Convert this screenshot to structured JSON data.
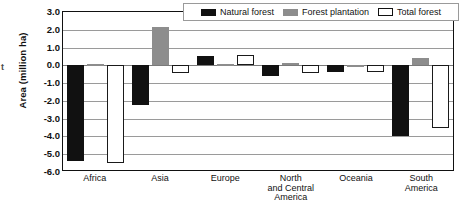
{
  "chart_data": {
    "type": "bar",
    "title": "",
    "xlabel": "",
    "ylabel": "Area (million ha)",
    "ylim": [
      -6.0,
      3.0
    ],
    "ytick_step": 1.0,
    "grid": true,
    "legend_position": "top-right",
    "yticks": [
      "3.0",
      "2.0",
      "1.0",
      "0.0",
      "-1.0",
      "-2.0",
      "-3.0",
      "-4.0",
      "-5.0",
      "-6.0"
    ],
    "categories": [
      "Africa",
      "Asia",
      "Europe",
      "North and Central America",
      "Oceania",
      "South America"
    ],
    "category_lines": [
      [
        "Africa"
      ],
      [
        "Asia"
      ],
      [
        "Europe"
      ],
      [
        "North",
        "and Central",
        "America"
      ],
      [
        "Oceania"
      ],
      [
        "South",
        "America"
      ]
    ],
    "series": [
      {
        "name": "Natural forest",
        "color": "#111111",
        "values": [
          -5.4,
          -2.25,
          0.55,
          -0.6,
          -0.35,
          -3.95
        ]
      },
      {
        "name": "Forest plantation",
        "color": "#8d8d8d",
        "values": [
          0.1,
          2.15,
          0.05,
          0.15,
          0.03,
          0.4
        ]
      },
      {
        "name": "Total forest",
        "color": "#ffffff",
        "values": [
          -5.5,
          -0.45,
          0.6,
          -0.45,
          -0.35,
          -3.55
        ]
      }
    ]
  },
  "legend": {
    "items": [
      {
        "label": "Natural forest",
        "swatch": "natural"
      },
      {
        "label": "Forest plantation",
        "swatch": "plantation"
      },
      {
        "label": "Total forest",
        "swatch": "total"
      }
    ]
  },
  "stray_text": "t"
}
